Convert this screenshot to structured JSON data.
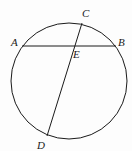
{
  "diagram": {
    "type": "circle-intersecting-chords",
    "circle": {
      "cx": 69,
      "cy": 81,
      "r": 58
    },
    "points": {
      "A": {
        "label": "A",
        "x": 22,
        "y": 46,
        "lx": 12,
        "ly": 46
      },
      "B": {
        "label": "B",
        "x": 116,
        "y": 46,
        "lx": 119,
        "ly": 46
      },
      "C": {
        "label": "C",
        "x": 82,
        "y": 23,
        "lx": 83,
        "ly": 17
      },
      "D": {
        "label": "D",
        "x": 47,
        "y": 136,
        "lx": 38,
        "ly": 149
      },
      "E": {
        "label": "E",
        "x": 77,
        "y": 46,
        "lx": 74,
        "ly": 58
      }
    },
    "chords": [
      {
        "name": "AB",
        "from": "A",
        "to": "B"
      },
      {
        "name": "CD",
        "from": "C",
        "to": "D"
      }
    ],
    "stroke_color": "#1a1a1a"
  }
}
